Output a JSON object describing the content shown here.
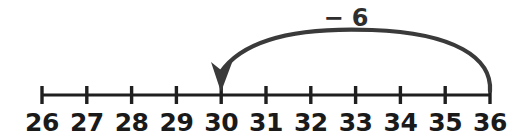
{
  "figure": {
    "background_color": "#ffffff",
    "axis_color": "#1f1f1f",
    "label_color": "#1a1a1a",
    "arc_color": "#3a3a3a"
  },
  "number_line": {
    "start_value": 26,
    "end_value": 36,
    "step": 1,
    "axis_y": 95,
    "first_tick_x": 42,
    "tick_spacing": 44.8,
    "tick_top_y": 86,
    "tick_bottom_y": 104,
    "label_baseline_y": 131,
    "ticks": [
      {
        "value": 26,
        "label": "26",
        "x": 42
      },
      {
        "value": 27,
        "label": "27",
        "x": 86.8
      },
      {
        "value": 28,
        "label": "28",
        "x": 131.6
      },
      {
        "value": 29,
        "label": "29",
        "x": 176.4
      },
      {
        "value": 30,
        "label": "30",
        "x": 221.2
      },
      {
        "value": 31,
        "label": "31",
        "x": 266
      },
      {
        "value": 32,
        "label": "32",
        "x": 310.8
      },
      {
        "value": 33,
        "label": "33",
        "x": 355.6
      },
      {
        "value": 34,
        "label": "34",
        "x": 400.4
      },
      {
        "value": 35,
        "label": "35",
        "x": 445.2
      },
      {
        "value": 36,
        "label": "36",
        "x": 490
      }
    ]
  },
  "jump": {
    "label": "− 6",
    "operation": "subtraction",
    "amount": 6,
    "from_value": 36,
    "to_value": 30,
    "direction": "left",
    "label_x": 346,
    "label_baseline_y": 26,
    "arc_path": "M 490 91 C 492 58 455 33 372 30 C 295 27 243 40 221 72",
    "arrow_head_points": "221,92 211,62 221,70 233,60"
  }
}
